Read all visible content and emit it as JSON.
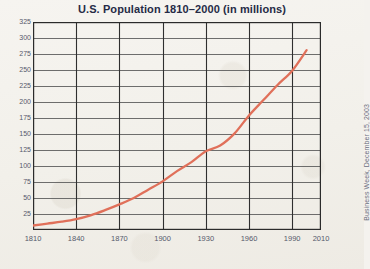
{
  "figure": {
    "background_color": "#f4f2ee",
    "source_credit": "Business Week, December 15, 2003"
  },
  "chart_data": {
    "type": "line",
    "title": "U.S. Population 1810–2000 (in millions)",
    "xlabel": "",
    "ylabel": "",
    "xlim": [
      1810,
      2010
    ],
    "ylim": [
      0,
      325
    ],
    "grid": true,
    "legend": false,
    "line_color": "#e0705a",
    "x_ticks": [
      1810,
      1840,
      1870,
      1900,
      1930,
      1960,
      1990,
      2010
    ],
    "x_tick_labels": [
      "1810",
      "1840",
      "1870",
      "1900",
      "1930",
      "1960",
      "1990",
      "2010"
    ],
    "y_ticks": [
      25,
      50,
      75,
      100,
      125,
      150,
      175,
      200,
      225,
      250,
      275,
      300,
      325
    ],
    "y_tick_labels": [
      "25",
      "50",
      "75",
      "100",
      "125",
      "150",
      "175",
      "200",
      "225",
      "250",
      "275",
      "300",
      "325"
    ],
    "x": [
      1810,
      1820,
      1830,
      1840,
      1850,
      1860,
      1870,
      1880,
      1890,
      1900,
      1910,
      1920,
      1930,
      1940,
      1950,
      1960,
      1970,
      1980,
      1990,
      2000
    ],
    "values": [
      7,
      10,
      13,
      17,
      23,
      31,
      40,
      50,
      63,
      76,
      92,
      106,
      123,
      132,
      151,
      179,
      203,
      227,
      249,
      281
    ],
    "series": [
      {
        "name": "U.S. Population (millions)",
        "values": [
          7,
          10,
          13,
          17,
          23,
          31,
          40,
          50,
          63,
          76,
          92,
          106,
          123,
          132,
          151,
          179,
          203,
          227,
          249,
          281
        ]
      }
    ]
  }
}
